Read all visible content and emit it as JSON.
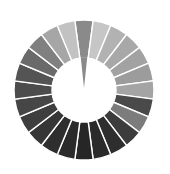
{
  "ring": {
    "center": [
      84,
      90
    ],
    "outer_radius": 70,
    "inner_radius": 32,
    "segment_count": 24,
    "gap_color": "#ffffff",
    "needle": {
      "segment_index": 0,
      "color": "#8a8a8a",
      "tip_radius": 2
    },
    "segments": [
      "#8a8a8a",
      "#c6c6c6",
      "#b2b2b2",
      "#a8a8a8",
      "#a2a2a2",
      "#9c9c9c",
      "#a4a4a4",
      "#4a4a4a",
      "#7c7c7c",
      "#3c3c3c",
      "#2e2e2e",
      "#2a2a2a",
      "#262626",
      "#2a2a2a",
      "#2e2e2e",
      "#363636",
      "#3e3e3e",
      "#464646",
      "#4c4c4c",
      "#545454",
      "#6a6a6a",
      "#808080",
      "#a6a6a6",
      "#c2c2c2"
    ]
  }
}
